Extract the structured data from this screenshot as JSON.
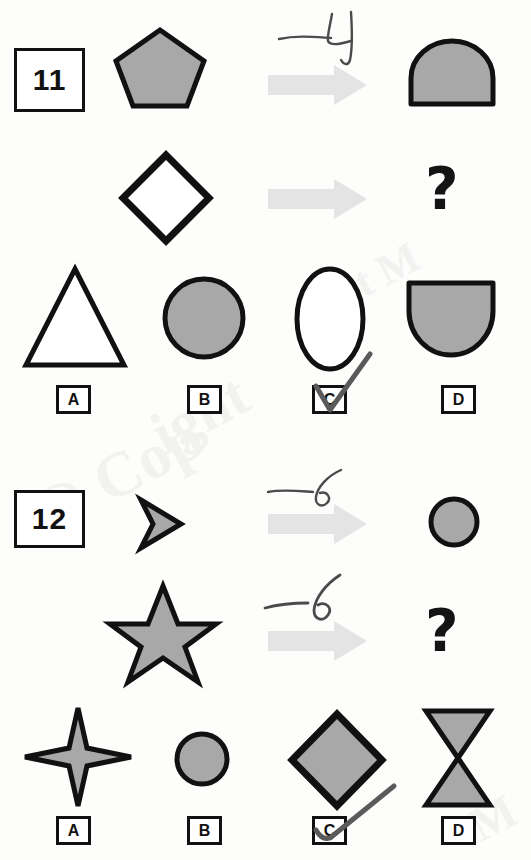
{
  "page": {
    "kind": "printed-aptitude-test-scan",
    "background_color": "#fdfdfc",
    "ink_color": "#111111",
    "fill_gray": "#a8a8a8",
    "arrow_gray": "#e4e4e4",
    "handwriting_color": "#4b4b4b",
    "watermark_texts": [
      "ight",
      "@ Cop",
      "ht M",
      "M"
    ]
  },
  "questions": [
    {
      "number": "11",
      "prompt_rows": [
        {
          "left_shape": "pentagon",
          "operator_annotation": "-4",
          "arrow": "right-arrow",
          "right_shape": "dome"
        },
        {
          "left_shape": "diamond-outline",
          "operator_annotation": "",
          "arrow": "right-arrow",
          "right_shape": "question-mark",
          "right_label": "?"
        }
      ],
      "options": [
        {
          "letter": "A",
          "shape": "triangle-outline",
          "selected": false
        },
        {
          "letter": "B",
          "shape": "circle-filled",
          "selected": false
        },
        {
          "letter": "C",
          "shape": "ellipse-outline",
          "selected": true
        },
        {
          "letter": "D",
          "shape": "dome-down",
          "selected": false
        }
      ]
    },
    {
      "number": "12",
      "prompt_rows": [
        {
          "left_shape": "chevron",
          "operator_annotation": "-6",
          "arrow": "right-arrow",
          "right_shape": "circle-small-filled"
        },
        {
          "left_shape": "star-5",
          "operator_annotation": "-6",
          "arrow": "right-arrow",
          "right_shape": "question-mark",
          "right_label": "?"
        }
      ],
      "options": [
        {
          "letter": "A",
          "shape": "star-4",
          "selected": false
        },
        {
          "letter": "B",
          "shape": "circle-small-filled",
          "selected": false
        },
        {
          "letter": "C",
          "shape": "diamond-filled",
          "selected": true
        },
        {
          "letter": "D",
          "shape": "hourglass-filled",
          "selected": false
        }
      ]
    }
  ]
}
